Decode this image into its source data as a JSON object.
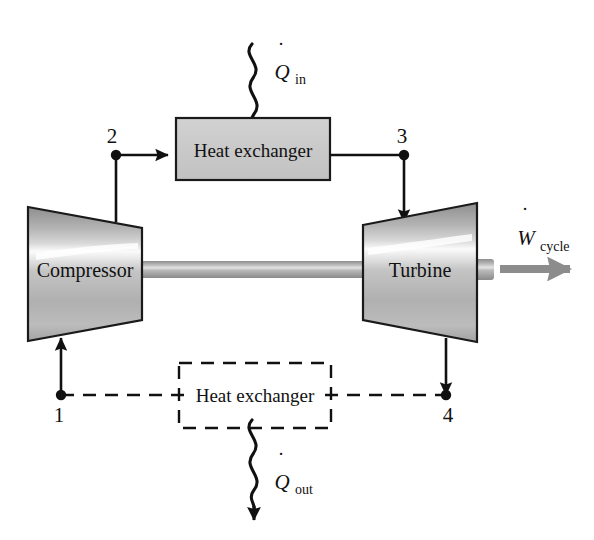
{
  "diagram": {
    "type": "brayton-cycle-schematic",
    "background_color": "#ffffff",
    "line_color": "#111111",
    "fill_gray": "#c8c8c8",
    "shaft_gray": "#9a9a9a",
    "work_arrow_gray": "#8c8c8c"
  },
  "components": {
    "compressor": {
      "label": "Compressor"
    },
    "turbine": {
      "label": "Turbine"
    },
    "heat_exchanger_top": {
      "label": "Heat exchanger"
    },
    "heat_exchanger_bottom": {
      "label": "Heat exchanger"
    }
  },
  "states": {
    "one": "1",
    "two": "2",
    "three": "3",
    "four": "4"
  },
  "flows": {
    "heat_in": {
      "symbol": "Q",
      "subscript": "in",
      "dot": "˙"
    },
    "heat_out": {
      "symbol": "Q",
      "subscript": "out",
      "dot": "˙"
    },
    "work_cycle": {
      "symbol": "W",
      "subscript": "cycle",
      "dot": "˙"
    }
  }
}
